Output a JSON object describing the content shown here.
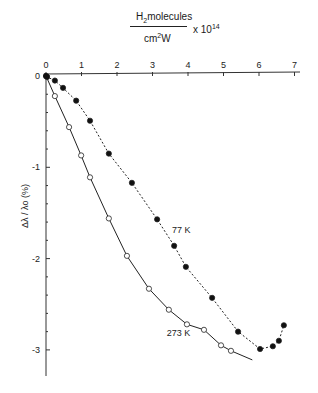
{
  "chart_data": {
    "type": "scatter",
    "title": "",
    "xlabel": "H2 molecules / (cm^2 W) x 10^14",
    "xlabel_parts": {
      "numerator_prefix": "H",
      "numerator_sub": "2",
      "numerator_rest": "molecules",
      "denominator_prefix": "cm",
      "denominator_sup": "2",
      "denominator_rest": "W",
      "multiplier": "x 10",
      "multiplier_exp": "14"
    },
    "ylabel": "Δλ / λo (%)",
    "xlim": [
      0,
      7
    ],
    "ylim": [
      -3.3,
      0
    ],
    "x_ticks": [
      "0",
      "1",
      "2",
      "3",
      "4",
      "5",
      "6",
      "7"
    ],
    "y_ticks": [
      "0",
      "-1",
      "-2",
      "-3"
    ],
    "x_axis_position": "top",
    "grid": false,
    "legend": "none (inline curve labels)",
    "series": [
      {
        "name": "77 K",
        "marker": "filled-circle",
        "line": "dotted",
        "label_position": [
          3.55,
          -1.72
        ],
        "points": [
          [
            0.0,
            0.0
          ],
          [
            0.03,
            -0.01
          ],
          [
            0.25,
            -0.05
          ],
          [
            0.48,
            -0.13
          ],
          [
            0.85,
            -0.27
          ],
          [
            1.24,
            -0.49
          ],
          [
            1.77,
            -0.85
          ],
          [
            2.42,
            -1.17
          ],
          [
            3.13,
            -1.57
          ],
          [
            3.61,
            -1.86
          ],
          [
            3.94,
            -2.09
          ],
          [
            4.68,
            -2.43
          ],
          [
            5.41,
            -2.8
          ],
          [
            6.03,
            -2.99
          ],
          [
            6.39,
            -2.96
          ],
          [
            6.56,
            -2.9
          ],
          [
            6.7,
            -2.73
          ]
        ]
      },
      {
        "name": "273 K",
        "marker": "open-circle",
        "line": "solid",
        "label_position": [
          3.4,
          -2.85
        ],
        "points": [
          [
            0.0,
            0.0
          ],
          [
            0.25,
            -0.22
          ],
          [
            0.65,
            -0.56
          ],
          [
            0.99,
            -0.87
          ],
          [
            1.24,
            -1.11
          ],
          [
            1.77,
            -1.56
          ],
          [
            2.28,
            -1.97
          ],
          [
            2.9,
            -2.33
          ],
          [
            3.46,
            -2.56
          ],
          [
            3.97,
            -2.72
          ],
          [
            4.45,
            -2.78
          ],
          [
            4.93,
            -2.95
          ],
          [
            5.21,
            -3.01
          ]
        ]
      }
    ]
  }
}
